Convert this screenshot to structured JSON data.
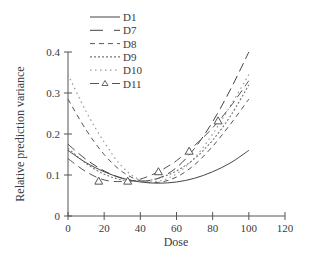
{
  "chart_data": {
    "type": "line",
    "title": "",
    "xlabel": "Dose",
    "ylabel": "Relative prediction variance",
    "xlim": [
      0,
      120
    ],
    "ylim": [
      0,
      0.4
    ],
    "x_ticks": [
      0,
      20,
      40,
      60,
      80,
      100,
      120
    ],
    "y_ticks": [
      0,
      0.1,
      0.2,
      0.3,
      0.4
    ],
    "x_tick_labels": [
      "0",
      "20",
      "40",
      "60",
      "80",
      "100",
      "120"
    ],
    "y_tick_labels": [
      "0",
      "0.1",
      "0.2",
      "0.3",
      "0.4"
    ],
    "grid": false,
    "legend_position": "top-left",
    "x": [
      0,
      10,
      20,
      30,
      40,
      50,
      60,
      70,
      80,
      90,
      100
    ],
    "series": [
      {
        "name": "D1",
        "style": "solid",
        "values": [
          0.16,
          0.13,
          0.108,
          0.092,
          0.083,
          0.08,
          0.083,
          0.092,
          0.108,
          0.13,
          0.16
        ]
      },
      {
        "name": "D7",
        "style": "long-dash",
        "values": [
          0.175,
          0.138,
          0.11,
          0.092,
          0.085,
          0.092,
          0.118,
          0.165,
          0.23,
          0.31,
          0.4
        ]
      },
      {
        "name": "D8",
        "style": "short-dash",
        "values": [
          0.285,
          0.21,
          0.15,
          0.108,
          0.086,
          0.082,
          0.095,
          0.125,
          0.17,
          0.225,
          0.285
        ]
      },
      {
        "name": "D9",
        "style": "dense-dot",
        "values": [
          0.165,
          0.128,
          0.102,
          0.088,
          0.085,
          0.092,
          0.11,
          0.14,
          0.185,
          0.245,
          0.32
        ]
      },
      {
        "name": "D10",
        "style": "sparse-dot",
        "values": [
          0.345,
          0.255,
          0.18,
          0.12,
          0.088,
          0.085,
          0.103,
          0.142,
          0.2,
          0.27,
          0.345
        ]
      },
      {
        "name": "D11",
        "style": "dash-triangle",
        "values": [
          0.14,
          0.108,
          0.088,
          0.084,
          0.09,
          0.108,
          0.135,
          0.172,
          0.215,
          0.268,
          0.33
        ],
        "markers": [
          {
            "x": 17,
            "y": 0.085
          },
          {
            "x": 33,
            "y": 0.085
          },
          {
            "x": 50,
            "y": 0.108
          },
          {
            "x": 67,
            "y": 0.158
          },
          {
            "x": 83,
            "y": 0.232
          }
        ]
      }
    ]
  },
  "legend": {
    "items": [
      "D1",
      "D7",
      "D8",
      "D9",
      "D10",
      "D11"
    ]
  }
}
